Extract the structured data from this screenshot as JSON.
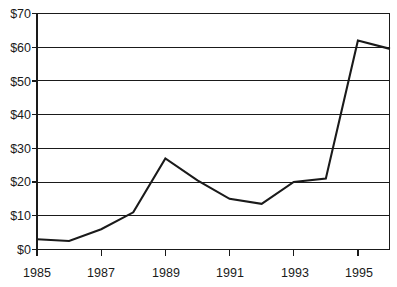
{
  "chart_data": {
    "type": "line",
    "title": "",
    "subtitle": "",
    "xlabel": "",
    "ylabel": "",
    "x": [
      1985,
      1986,
      1987,
      1988,
      1989,
      1990,
      1991,
      1992,
      1993,
      1994,
      1995,
      1996
    ],
    "values": [
      3,
      2.5,
      6,
      11,
      27,
      20.5,
      15,
      13.5,
      20,
      21,
      62,
      59.5
    ],
    "series": [
      {
        "name": "",
        "values": [
          3,
          2.5,
          6,
          11,
          27,
          20.5,
          15,
          13.5,
          20,
          21,
          62,
          59.5
        ],
        "color": "#1a1a1a"
      }
    ],
    "xlim": [
      1985,
      1996
    ],
    "ylim": [
      0,
      70
    ],
    "y_ticks": [
      0,
      10,
      20,
      30,
      40,
      50,
      60,
      70
    ],
    "y_tick_labels": [
      "$0",
      "$10",
      "$20",
      "$30",
      "$40",
      "$50",
      "$60",
      "$70"
    ],
    "x_ticks": [
      1985,
      1987,
      1989,
      1991,
      1993,
      1995
    ],
    "x_tick_labels": [
      "1985",
      "1987",
      "1989",
      "1991",
      "1993",
      "1995"
    ],
    "grid": "horizontal",
    "legend": "none",
    "annotations": []
  },
  "axes": {
    "y_labels": [
      "$70",
      "$60",
      "$50",
      "$40",
      "$30",
      "$20",
      "$10",
      "$0"
    ],
    "x_labels": [
      "1985",
      "1987",
      "1989",
      "1991",
      "1993",
      "1995"
    ]
  },
  "colors": {
    "line": "#1a1a1a",
    "grid": "#1a1a1a",
    "background": "#ffffff",
    "text": "#1a1a1a"
  }
}
